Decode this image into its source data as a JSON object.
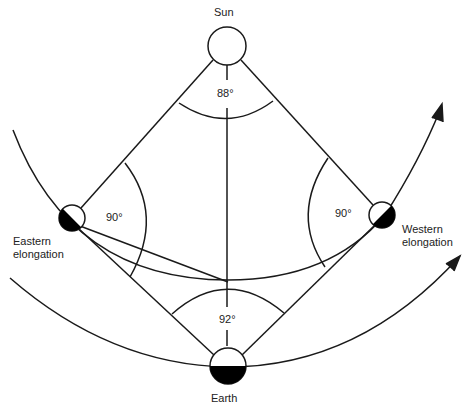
{
  "diagram": {
    "labels": {
      "sun": "Sun",
      "earth": "Earth",
      "eastern_line1": "Eastern",
      "eastern_line2": "elongation",
      "western_line1": "Western",
      "western_line2": "elongation"
    },
    "angles": {
      "sun_angle": "88°",
      "eastern_angle": "90°",
      "western_angle": "90°",
      "earth_angle": "92°"
    },
    "colors": {
      "line": "#1a1a1a",
      "background": "#ffffff",
      "shadow": "#000000"
    }
  }
}
